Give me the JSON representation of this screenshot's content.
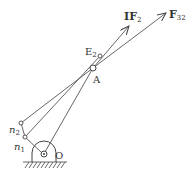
{
  "diagram": {
    "labels": {
      "IF2": "IF",
      "IF2_sub": "2",
      "F32": "F",
      "F32_sub": "32",
      "E2": "E",
      "E2_sub": "2",
      "A": "A",
      "O": "O",
      "n1": "n",
      "n1_sub": "1",
      "n2": "n",
      "n2_sub": "2"
    },
    "points": {
      "O": [
        44,
        154
      ],
      "A": [
        93,
        68
      ],
      "E2": [
        100,
        56
      ],
      "n1": [
        25,
        137
      ],
      "n2": [
        21,
        123
      ],
      "IF2_tip": [
        129,
        26
      ],
      "F32_tip": [
        166,
        13
      ]
    },
    "colors": {
      "line": "#444444",
      "text": "#333333"
    }
  }
}
